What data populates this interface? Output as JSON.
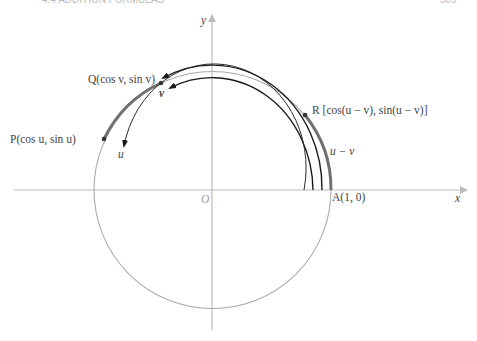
{
  "header": {
    "left": "4.4  ADDITION FORMULAS",
    "right": "309"
  },
  "figure": {
    "axes": {
      "x_label": "x",
      "y_label": "y",
      "origin_label": "O"
    },
    "points": {
      "P": {
        "label": "P(cos u, sin u)"
      },
      "Q": {
        "label": "Q(cos v, sin v)"
      },
      "R": {
        "label": "R [cos(u − v), sin(u − v)]"
      },
      "A": {
        "label": "A(1, 0)"
      }
    },
    "arc_labels": {
      "u": "u",
      "v": "v",
      "u_minus_v": "u − v"
    },
    "colors": {
      "axis": "#b8b8b8",
      "circle": "#a8a8a8",
      "thick_arc": "#6e6e6e",
      "arrow_arc": "#1a1a1a"
    }
  }
}
